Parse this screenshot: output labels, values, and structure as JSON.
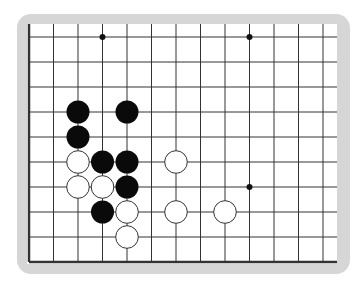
{
  "board": {
    "type": "go-diagram",
    "visible_columns": 13,
    "visible_rows": 10,
    "edges": [
      "left",
      "bottom"
    ],
    "grid_color": "#333333",
    "frame_color": "#d6d6d6",
    "hoshi": [
      [
        3,
        0
      ],
      [
        9,
        0
      ],
      [
        9,
        6
      ]
    ],
    "black_stones": [
      [
        2,
        3
      ],
      [
        4,
        3
      ],
      [
        2,
        4
      ],
      [
        3,
        5
      ],
      [
        4,
        5
      ],
      [
        4,
        6
      ],
      [
        3,
        7
      ]
    ],
    "white_stones": [
      [
        2,
        5
      ],
      [
        6,
        5
      ],
      [
        2,
        6
      ],
      [
        3,
        6
      ],
      [
        4,
        7
      ],
      [
        6,
        7
      ],
      [
        8,
        7
      ],
      [
        4,
        8
      ]
    ]
  }
}
